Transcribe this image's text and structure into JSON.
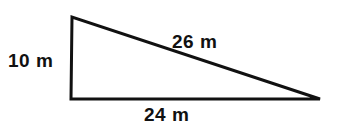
{
  "figure": {
    "kind": "right-triangle-diagram",
    "background_color": "#ffffff",
    "stroke_color": "#111111",
    "text_color": "#111111",
    "stroke_width": 3,
    "vertices": {
      "top_left": {
        "x": 72,
        "y": 17
      },
      "bottom_left": {
        "x": 71,
        "y": 99
      },
      "bottom_right": {
        "x": 320,
        "y": 99
      }
    },
    "labels": {
      "vertical_leg": "10 m",
      "hypotenuse": "26 m",
      "base": "24 m"
    }
  },
  "chart_data": {
    "type": "diagram",
    "title": "",
    "shape": "right triangle",
    "sides": [
      {
        "name": "vertical leg",
        "label": "10 m",
        "value": 10,
        "unit": "m"
      },
      {
        "name": "base",
        "label": "24 m",
        "value": 24,
        "unit": "m"
      },
      {
        "name": "hypotenuse",
        "label": "26 m",
        "value": 26,
        "unit": "m"
      }
    ],
    "right_angle_at": "bottom-left"
  }
}
